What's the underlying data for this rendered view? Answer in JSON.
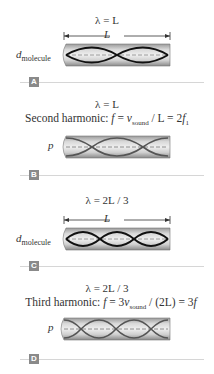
{
  "panels": [
    {
      "id": "A",
      "lambda": "λ = L",
      "dimension_label": "L",
      "side_label": {
        "main": "d",
        "sub": "molecule"
      },
      "wave": {
        "kind": "displacement",
        "loops": 2
      },
      "badge": "A"
    },
    {
      "id": "B",
      "lambda": "λ = L",
      "equation": {
        "prefix": "Second harmonic: ",
        "f": "f",
        "eq1": " = ",
        "v": "v",
        "vsub": "sound",
        "mid": " / L = 2",
        "f2": "f",
        "f2sub": "1"
      },
      "side_label": {
        "main": "p"
      },
      "wave": {
        "kind": "pressure",
        "loops": 2
      },
      "badge": "B"
    },
    {
      "id": "C",
      "lambda": "λ = 2L / 3",
      "dimension_label": "L",
      "side_label": {
        "main": "d",
        "sub": "molecule"
      },
      "wave": {
        "kind": "displacement",
        "loops": 3
      },
      "badge": "C"
    },
    {
      "id": "D",
      "lambda": "λ = 2L / 3",
      "equation": {
        "prefix": "Third harmonic: ",
        "f": "f",
        "eq1": " = 3",
        "v": "v",
        "vsub": "sound",
        "mid": " / (2L) = 3",
        "f2": "f"
      },
      "side_label": {
        "main": "p"
      },
      "wave": {
        "kind": "pressure",
        "loops": 3
      },
      "badge": "D"
    }
  ],
  "colors": {
    "tube_dark": "#8c8c8c",
    "tube_light": "#e6e6e6",
    "wave": "#111111",
    "pressure_wave": "#555555",
    "axis_dash": "#888888",
    "badge": "#8a8a8a"
  }
}
